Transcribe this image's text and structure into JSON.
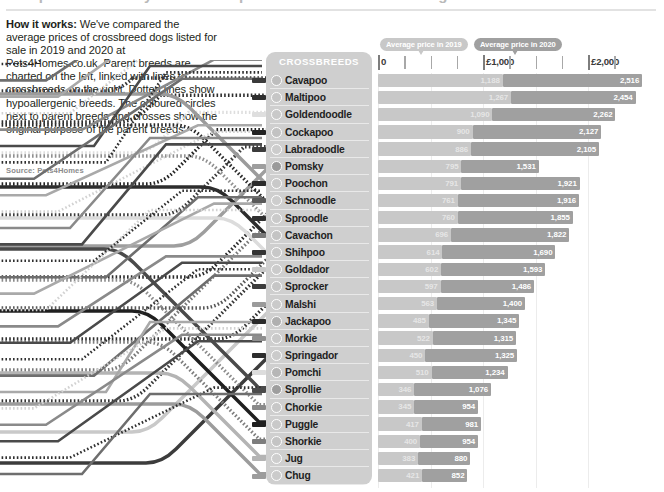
{
  "headline": {
    "text": "Comparison chart by crossbreed price for 2019 and 2020 listings"
  },
  "intro": {
    "lead": "How it works:",
    "body": " We've compared the average prices of crossbreed dogs listed for sale in 2019 and 2020 at Pets4Homes.co.uk. Parent breeds are charted on the left, linked with lines to crossbreeds on the right. Dotted lines show hypoallergenic breeds. The coloured circles next to parent breeds and crosses show the original purpose of the parent breeds",
    "source": "Source: Pets4Homes"
  },
  "panel": {
    "title": "CROSSBREEDS"
  },
  "legend": [
    {
      "label": "Average price in 2019",
      "color": "#c8c8c8"
    },
    {
      "label": "Average price in 2020",
      "color": "#a0a0a0"
    }
  ],
  "axis": {
    "labels": [
      "0",
      "£1,000",
      "£2,000"
    ],
    "major_values": [
      0,
      1000,
      2000
    ],
    "minor_values": [
      250,
      500,
      750,
      1250,
      1500,
      1750,
      2250
    ],
    "max": 2400
  },
  "chart_data": {
    "type": "bar",
    "xlabel": "Average price (£)",
    "ylabel": "Crossbreed",
    "xlim": [
      0,
      2400
    ],
    "grid": true,
    "legend_position": "top",
    "categories": [
      "Cavapoo",
      "Maltipoo",
      "Goldendoodle",
      "Cockapoo",
      "Labradoodle",
      "Pomsky",
      "Poochon",
      "Schnoodle",
      "Sproodle",
      "Cavachon",
      "Shihpoo",
      "Goldador",
      "Sprocker",
      "Malshi",
      "Jackapoo",
      "Morkie",
      "Springador",
      "Pomchi",
      "Sprollie",
      "Chorkie",
      "Puggle",
      "Shorkie",
      "Jug",
      "Chug"
    ],
    "series": [
      {
        "name": "Average price in 2019",
        "color": "#c8c8c8",
        "values": [
          1188,
          1267,
          1090,
          900,
          886,
          795,
          791,
          761,
          760,
          696,
          614,
          602,
          597,
          563,
          485,
          522,
          450,
          510,
          346,
          345,
          417,
          400,
          383,
          421
        ]
      },
      {
        "name": "Average price in 2020",
        "color": "#a0a0a0",
        "values": [
          2516,
          2454,
          2262,
          2127,
          2105,
          1531,
          1921,
          1916,
          1855,
          1822,
          1690,
          1593,
          1486,
          1400,
          1345,
          1315,
          1325,
          1234,
          1076,
          954,
          981,
          954,
          880,
          852
        ]
      }
    ]
  },
  "breeds": [
    {
      "name": "Cavapoo",
      "dot": "#bdbdbd",
      "stub": "#3a3a3a",
      "dotted": true
    },
    {
      "name": "Maltipoo",
      "dot": "#c6c6c6",
      "stub": "#2e2e2e",
      "dotted": true
    },
    {
      "name": "Goldendoodle",
      "dot": "#c9c9c9",
      "stub": "#dedede",
      "dotted": true
    },
    {
      "name": "Cockapoo",
      "dot": "#c2c2c2",
      "stub": "#232323",
      "dotted": true
    },
    {
      "name": "Labradoodle",
      "dot": "#cccccc",
      "stub": "#3b3b3b",
      "dotted": true
    },
    {
      "name": "Pomsky",
      "dot": "#9a9a9a",
      "stub": "#9e9e9e",
      "dotted": false
    },
    {
      "name": "Poochon",
      "dot": "#c9c9c9",
      "stub": "#2b2b2b",
      "dotted": true
    },
    {
      "name": "Schnoodle",
      "dot": "#cdcdcd",
      "stub": "#585858",
      "dotted": true
    },
    {
      "name": "Sproodle",
      "dot": "#cacaca",
      "stub": "#2f2f2f",
      "dotted": true
    },
    {
      "name": "Cavachon",
      "dot": "#c4c4c4",
      "stub": "#787878",
      "dotted": true
    },
    {
      "name": "Shihpoo",
      "dot": "#c8c8c8",
      "stub": "#343434",
      "dotted": true
    },
    {
      "name": "Goldador",
      "dot": "#cbcbcb",
      "stub": "#c9c9c9",
      "dotted": false
    },
    {
      "name": "Sprocker",
      "dot": "#c6c6c6",
      "stub": "#3c3c3c",
      "dotted": false
    },
    {
      "name": "Malshi",
      "dot": "#cacaca",
      "stub": "#9b9b9b",
      "dotted": false
    },
    {
      "name": "Jackapoo",
      "dot": "#b0b0b0",
      "stub": "#2a2a2a",
      "dotted": true
    },
    {
      "name": "Morkie",
      "dot": "#c9c9c9",
      "stub": "#8f8f8f",
      "dotted": true
    },
    {
      "name": "Springador",
      "dot": "#cbcbcb",
      "stub": "#2d2d2d",
      "dotted": false
    },
    {
      "name": "Pomchi",
      "dot": "#b6b6b6",
      "stub": "#dcdcdc",
      "dotted": false
    },
    {
      "name": "Sprollie",
      "dot": "#9e9e9e",
      "stub": "#4a4a4a",
      "dotted": false
    },
    {
      "name": "Chorkie",
      "dot": "#c7c7c7",
      "stub": "#8a8a8a",
      "dotted": true
    },
    {
      "name": "Puggle",
      "dot": "#c9c9c9",
      "stub": "#1f1f1f",
      "dotted": false
    },
    {
      "name": "Shorkie",
      "dot": "#c4c4c4",
      "stub": "#7d7d7d",
      "dotted": true
    },
    {
      "name": "Jug",
      "dot": "#cdcdcd",
      "stub": "#b4b4b4",
      "dotted": false
    },
    {
      "name": "Chug",
      "dot": "#cbcbcb",
      "stub": "#9c9c9c",
      "dotted": false
    }
  ]
}
